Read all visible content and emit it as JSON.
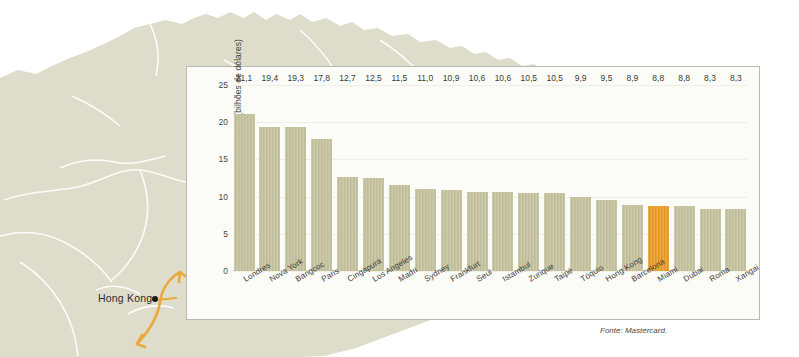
{
  "map": {
    "region_name": "asia-map",
    "city_label": "Hong Kong",
    "marker_name": "hong-kong-marker"
  },
  "source_note": "Fonte: Mastercard.",
  "colors": {
    "bar": "#c4c19c",
    "bar_highlight": "#eb9a22",
    "panel_border": "#b9b9b4",
    "map_land": "#dedccb",
    "arrow": "#e9a93a"
  },
  "chart_data": {
    "type": "bar",
    "title": "",
    "xlabel": "",
    "ylabel": "Gastos dos visitantes (bilhões de dólares)",
    "ylim": [
      0,
      25
    ],
    "yticks": [
      "25",
      "20",
      "15",
      "10",
      "5",
      "0"
    ],
    "ytick_values": [
      25,
      20,
      15,
      10,
      5,
      0
    ],
    "grid": true,
    "legend": "none",
    "highlight_category": "Miami",
    "categories": [
      "Londres",
      "Nova York",
      "Bangcoc",
      "Paris",
      "Cingapura",
      "Los Angeles",
      "Madri",
      "Sydney",
      "Frankfurt",
      "Seul",
      "Istambul",
      "Zurique",
      "Taipé",
      "Tóquio",
      "Hong Kong",
      "Barcelona",
      "Miami",
      "Dubai",
      "Roma",
      "Xangai"
    ],
    "values": [
      21.1,
      19.4,
      19.3,
      17.8,
      12.7,
      12.5,
      11.5,
      11.0,
      10.9,
      10.6,
      10.6,
      10.5,
      10.5,
      9.9,
      9.5,
      8.9,
      8.8,
      8.8,
      8.3,
      8.3
    ],
    "value_labels": [
      "21,1",
      "19,4",
      "19,3",
      "17,8",
      "12,7",
      "12,5",
      "11,5",
      "11,0",
      "10,9",
      "10,6",
      "10,6",
      "10,5",
      "10,5",
      "9,9",
      "9,5",
      "8,9",
      "8,8",
      "8,8",
      "8,3",
      "8,3"
    ]
  }
}
